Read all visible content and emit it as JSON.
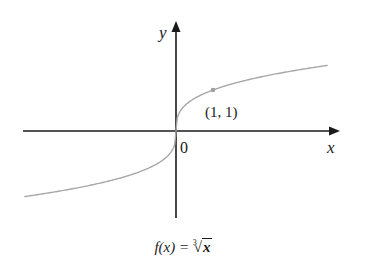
{
  "figure": {
    "x_axis_label": "x",
    "y_axis_label": "y",
    "origin_label": "0",
    "point_label": "(1, 1)",
    "caption": {
      "lhs": "f(x) = ",
      "root_index": "3",
      "radicand": "x"
    },
    "colors": {
      "axis": "#1a1a1a",
      "curve": "#a8a8a8",
      "point": "#a0a0a0",
      "background": "#ffffff"
    }
  },
  "chart_data": {
    "type": "line",
    "xlabel": "x",
    "ylabel": "y",
    "function": "cube root",
    "x": [
      -4.1,
      -3,
      -2,
      -1,
      -0.5,
      -0.1,
      0,
      0.1,
      0.5,
      1,
      2,
      3,
      4.1
    ],
    "values": [
      -1.6,
      -1.44,
      -1.26,
      -1,
      -0.79,
      -0.46,
      0,
      0.46,
      0.79,
      1,
      1.26,
      1.44,
      1.6
    ],
    "annotations": [
      {
        "x": 1,
        "y": 1,
        "label": "(1, 1)"
      },
      {
        "x": 0,
        "y": 0,
        "label": "0"
      }
    ],
    "xlim": [
      -4.2,
      4.5
    ],
    "ylim": [
      -2.1,
      2.6
    ],
    "grid": false,
    "legend": "none"
  }
}
